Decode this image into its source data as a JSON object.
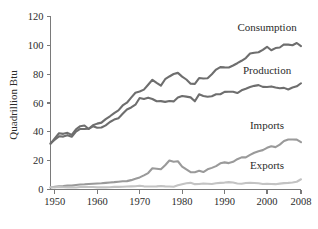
{
  "chart_data": {
    "type": "line",
    "title": "",
    "xlabel": "",
    "ylabel": "Quadrillion Btu",
    "xlim": [
      1949,
      2008
    ],
    "ylim": [
      0,
      120
    ],
    "xticks": [
      1950,
      1960,
      1970,
      1980,
      1990,
      2000,
      2008
    ],
    "yticks": [
      0,
      20,
      40,
      60,
      80,
      100,
      120
    ],
    "xtick_labels": [
      "1950",
      "1960",
      "1970",
      "1980",
      "1990",
      "2000",
      "2008"
    ],
    "ytick_labels": [
      "0",
      "20",
      "40",
      "60",
      "80",
      "100",
      "120"
    ],
    "grid": false,
    "legend_position": "inline-right",
    "x": [
      1949,
      1950,
      1951,
      1952,
      1953,
      1954,
      1955,
      1956,
      1957,
      1958,
      1959,
      1960,
      1961,
      1962,
      1963,
      1964,
      1965,
      1966,
      1967,
      1968,
      1969,
      1970,
      1971,
      1972,
      1973,
      1974,
      1975,
      1976,
      1977,
      1978,
      1979,
      1980,
      1981,
      1982,
      1983,
      1984,
      1985,
      1986,
      1987,
      1988,
      1989,
      1990,
      1991,
      1992,
      1993,
      1994,
      1995,
      1996,
      1997,
      1998,
      1999,
      2000,
      2001,
      2002,
      2003,
      2004,
      2005,
      2006,
      2007,
      2008
    ],
    "series": [
      {
        "name": "Consumption",
        "color": "#6e6e6e",
        "label_x": 2000,
        "label_y": 110,
        "values": [
          32.0,
          34.6,
          36.9,
          36.7,
          37.7,
          36.6,
          40.2,
          42.0,
          42.0,
          42.1,
          44.6,
          45.7,
          46.4,
          48.8,
          50.8,
          53.0,
          54.9,
          58.3,
          60.2,
          63.7,
          67.1,
          68.0,
          69.3,
          72.7,
          76.1,
          74.0,
          72.0,
          76.5,
          78.4,
          80.1,
          80.9,
          78.3,
          76.3,
          73.4,
          73.3,
          77.3,
          77.0,
          77.2,
          80.0,
          83.2,
          84.9,
          84.7,
          84.6,
          86.0,
          87.6,
          89.3,
          91.2,
          94.3,
          94.9,
          95.2,
          96.9,
          99.0,
          96.6,
          98.1,
          98.5,
          100.6,
          100.5,
          100.1,
          101.6,
          99.4
        ]
      },
      {
        "name": "Production",
        "color": "#6e6e6e",
        "label_x": 2000,
        "label_y": 80,
        "values": [
          31.7,
          35.5,
          39.0,
          38.6,
          39.3,
          37.9,
          41.7,
          43.9,
          44.4,
          42.0,
          43.8,
          42.8,
          43.0,
          44.5,
          46.8,
          48.5,
          49.5,
          52.5,
          55.5,
          56.9,
          58.8,
          63.5,
          62.8,
          63.7,
          62.8,
          61.2,
          61.3,
          60.8,
          61.4,
          61.1,
          63.8,
          64.8,
          64.4,
          63.9,
          61.2,
          66.0,
          64.9,
          64.3,
          64.7,
          66.1,
          66.1,
          67.7,
          67.8,
          67.8,
          66.9,
          68.8,
          69.9,
          71.1,
          71.9,
          72.4,
          71.2,
          71.1,
          71.5,
          70.7,
          70.2,
          70.5,
          69.4,
          70.7,
          71.6,
          73.7
        ]
      },
      {
        "name": "Imports",
        "color": "#9a9a9a",
        "label_x": 2000,
        "label_y": 42,
        "values": [
          1.4,
          1.9,
          2.2,
          2.4,
          2.7,
          2.7,
          3.1,
          3.5,
          3.6,
          3.8,
          4.0,
          4.2,
          4.3,
          4.6,
          4.9,
          5.1,
          5.4,
          5.7,
          5.8,
          6.5,
          7.4,
          8.4,
          9.8,
          11.4,
          14.7,
          14.4,
          14.0,
          16.8,
          20.1,
          19.3,
          19.6,
          15.9,
          13.9,
          12.0,
          12.0,
          13.0,
          12.1,
          14.0,
          15.0,
          16.2,
          18.2,
          18.8,
          18.3,
          19.2,
          21.0,
          22.3,
          22.3,
          24.0,
          25.5,
          26.6,
          27.3,
          28.9,
          30.0,
          29.4,
          31.1,
          33.6,
          34.7,
          34.7,
          34.6,
          32.8
        ]
      },
      {
        "name": "Exports",
        "color": "#c3c3c3",
        "label_x": 2000,
        "label_y": 14,
        "values": [
          1.6,
          1.5,
          1.7,
          1.6,
          1.4,
          1.5,
          1.4,
          1.7,
          1.9,
          1.7,
          1.7,
          1.5,
          1.5,
          1.5,
          1.6,
          1.8,
          1.8,
          1.9,
          2.1,
          2.2,
          2.3,
          2.6,
          2.2,
          2.1,
          2.1,
          2.2,
          2.4,
          2.2,
          2.1,
          1.9,
          2.9,
          3.7,
          4.3,
          4.6,
          3.7,
          3.8,
          4.2,
          4.0,
          3.8,
          4.3,
          4.6,
          4.8,
          5.1,
          4.9,
          4.2,
          4.0,
          4.5,
          4.6,
          4.5,
          4.3,
          3.8,
          4.0,
          3.8,
          3.7,
          4.1,
          4.4,
          4.6,
          4.9,
          5.4,
          7.1
        ]
      }
    ]
  },
  "axis": {
    "y_title": "Quadrillion Btu"
  }
}
